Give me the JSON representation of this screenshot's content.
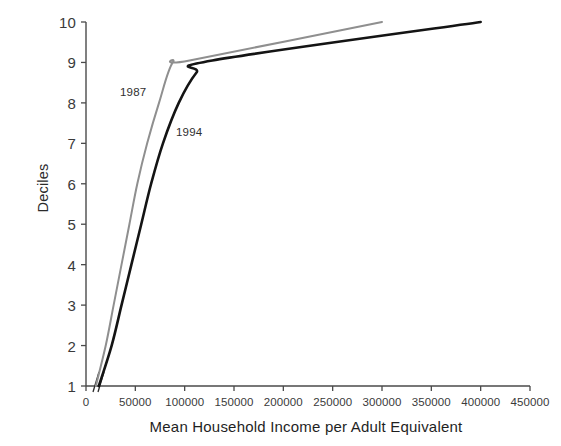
{
  "chart_data": {
    "type": "line",
    "title": "",
    "subtitle": "",
    "xlabel": "Mean Household Income per Adult Equivalent",
    "ylabel": "Deciles",
    "xlim": [
      0,
      450000
    ],
    "ylim": [
      1,
      10
    ],
    "grid": false,
    "legend_position": "inline-annotations",
    "x_ticks": [
      0,
      50000,
      100000,
      150000,
      200000,
      250000,
      300000,
      350000,
      400000,
      450000
    ],
    "x_tick_labels": [
      "0",
      "50000",
      "100000",
      "150000",
      "200000",
      "250000",
      "300000",
      "350000",
      "400000",
      "450000"
    ],
    "y_ticks": [
      1,
      2,
      3,
      4,
      5,
      6,
      7,
      8,
      9,
      10
    ],
    "y_tick_labels": [
      "1",
      "2",
      "3",
      "4",
      "5",
      "6",
      "7",
      "8",
      "9",
      "10"
    ],
    "annotations": [
      {
        "text": "1987",
        "x": 36000,
        "y": 8.35
      },
      {
        "text": "1994",
        "x": 92000,
        "y": 7.37
      }
    ],
    "axis_break": {
      "present": true,
      "axis": "x",
      "near_value": 6000,
      "symbol": "//"
    },
    "series": [
      {
        "name": "1987",
        "color": "#8f8f8f",
        "line_width": 2.0,
        "x": [
          10000,
          20000,
          28000,
          36000,
          44000,
          52000,
          62000,
          74000,
          88000,
          105000,
          300000
        ],
        "y": [
          1,
          2,
          3,
          4,
          5,
          6,
          7,
          8,
          9,
          9.05,
          10
        ],
        "decile_values": [
          {
            "decile": 1,
            "income": 10000
          },
          {
            "decile": 2,
            "income": 20000
          },
          {
            "decile": 3,
            "income": 28000
          },
          {
            "decile": 4,
            "income": 36000
          },
          {
            "decile": 5,
            "income": 44000
          },
          {
            "decile": 6,
            "income": 52000
          },
          {
            "decile": 7,
            "income": 62000
          },
          {
            "decile": 8,
            "income": 74000
          },
          {
            "decile": 9,
            "income": 103000
          },
          {
            "decile": 10,
            "income": 300000
          }
        ]
      },
      {
        "name": "1994",
        "color": "#141414",
        "line_width": 2.6,
        "x": [
          13000,
          26000,
          36000,
          46000,
          56000,
          66000,
          78000,
          94000,
          112000,
          128000,
          400000
        ],
        "y": [
          1,
          2,
          3,
          4,
          5,
          6,
          7,
          8,
          8.75,
          9.05,
          10
        ],
        "decile_values": [
          {
            "decile": 1,
            "income": 13000
          },
          {
            "decile": 2,
            "income": 26000
          },
          {
            "decile": 3,
            "income": 36000
          },
          {
            "decile": 4,
            "income": 46000
          },
          {
            "decile": 5,
            "income": 56000
          },
          {
            "decile": 6,
            "income": 66000
          },
          {
            "decile": 7,
            "income": 78000
          },
          {
            "decile": 8,
            "income": 94000
          },
          {
            "decile": 9,
            "income": 125000
          },
          {
            "decile": 10,
            "income": 400000
          }
        ]
      }
    ]
  },
  "axes": {
    "x_title": "Mean Household Income per Adult Equivalent",
    "y_title": "Deciles",
    "axis_color": "#4a4a4a"
  },
  "colors": {
    "background": "#ffffff",
    "series_1987": "#8f8f8f",
    "series_1994": "#141414",
    "axis": "#4a4a4a",
    "text": "#2b2b2b"
  }
}
